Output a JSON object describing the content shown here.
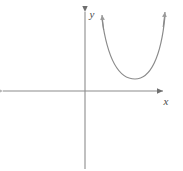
{
  "figure": {
    "kind": "coordinate-plane-graph",
    "width": 183,
    "height": 171,
    "background_color": "#ffffff",
    "title": "",
    "axis_color": "#8c8c8c",
    "curve_color": "#8a8a8a",
    "label_color": "#4a4a4a"
  },
  "axes": {
    "x_axis": {
      "label": "x",
      "label_x": 166,
      "label_y": 104,
      "line_y": 91,
      "line_x_start": 3,
      "line_x_end": 166,
      "arrow_end": "right",
      "arrow_start": "left"
    },
    "y_axis": {
      "label": "y",
      "label_x": 92,
      "label_y": 17,
      "line_x": 85,
      "line_y_start": 8,
      "line_y_end": 169,
      "arrow_end": "up"
    },
    "origin": {
      "x": 85,
      "y": 91
    }
  },
  "chart_data": {
    "type": "line",
    "title": "",
    "xlabel": "x",
    "ylabel": "y",
    "grid": false,
    "legend": null,
    "curves": [
      {
        "name": "upward-opening parabola",
        "shape": "parabola",
        "opens": "up",
        "vertex": {
          "x": 135,
          "y": 79
        },
        "endpoints": [
          {
            "x": 102,
            "y": 15,
            "arrow": true
          },
          {
            "x": 165,
            "y": 12,
            "arrow": true
          }
        ],
        "quadrant": "I",
        "path": "M 102 19 C 108 62, 120 79, 135 79 C 150 79, 161 58, 165 16",
        "color": "#8a8a8a",
        "stroke_width": 1.2
      }
    ],
    "annotations": []
  }
}
